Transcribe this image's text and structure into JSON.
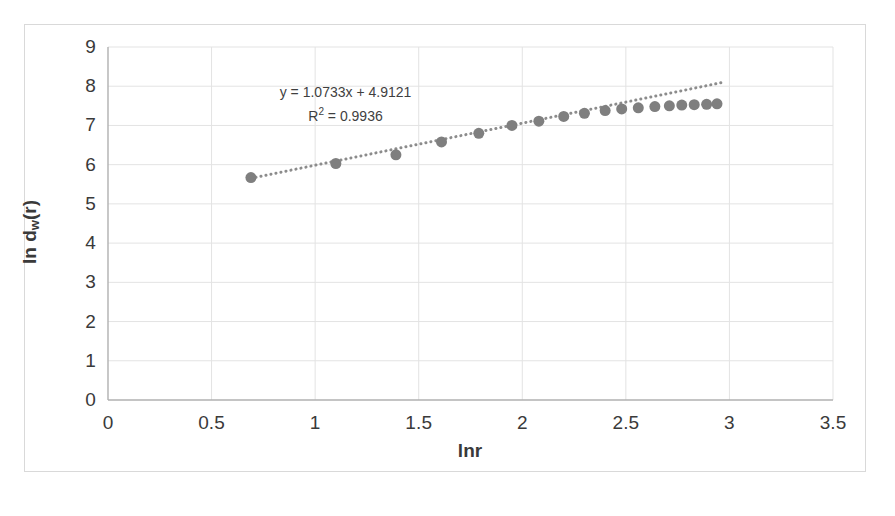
{
  "chart_data": {
    "type": "scatter",
    "title": "",
    "xlabel": "lnr",
    "ylabel": "ln dw(r)",
    "ylabel_base": "ln d",
    "ylabel_sub": "w",
    "ylabel_tail": "(r)",
    "xlim": [
      0,
      3.5
    ],
    "ylim": [
      0,
      9
    ],
    "xticks": [
      "0",
      "0.5",
      "1",
      "1.5",
      "2",
      "2.5",
      "3",
      "3.5"
    ],
    "xtick_values": [
      0,
      0.5,
      1,
      1.5,
      2,
      2.5,
      3,
      3.5
    ],
    "yticks": [
      "0",
      "1",
      "2",
      "3",
      "4",
      "5",
      "6",
      "7",
      "8",
      "9"
    ],
    "ytick_values": [
      0,
      1,
      2,
      3,
      4,
      5,
      6,
      7,
      8,
      9
    ],
    "grid": true,
    "legend": "none",
    "marker": {
      "shape": "circle",
      "color": "#7f7f7f",
      "size": 11
    },
    "trendline": {
      "style": "dotted",
      "color": "#8c8c8c",
      "width": 3,
      "slope": 1.0733,
      "intercept": 4.9121,
      "x_start": 0.69,
      "x_end": 2.96
    },
    "annotations": {
      "equation": "y = 1.0733x + 4.9121",
      "r_squared_prefix": "R",
      "r_squared_exp": "2",
      "r_squared_value": " = 0.9936"
    },
    "x": [
      0.69,
      1.1,
      1.39,
      1.61,
      1.79,
      1.95,
      2.08,
      2.2,
      2.3,
      2.4,
      2.48,
      2.56,
      2.64,
      2.71,
      2.77,
      2.83,
      2.89,
      2.94
    ],
    "y": [
      5.67,
      6.03,
      6.25,
      6.58,
      6.8,
      7.0,
      7.11,
      7.23,
      7.31,
      7.38,
      7.42,
      7.45,
      7.48,
      7.5,
      7.52,
      7.53,
      7.54,
      7.55
    ],
    "points": [
      {
        "x": 0.69,
        "y": 5.67
      },
      {
        "x": 1.1,
        "y": 6.03
      },
      {
        "x": 1.39,
        "y": 6.25
      },
      {
        "x": 1.61,
        "y": 6.58
      },
      {
        "x": 1.79,
        "y": 6.8
      },
      {
        "x": 1.95,
        "y": 7.0
      },
      {
        "x": 2.08,
        "y": 7.11
      },
      {
        "x": 2.2,
        "y": 7.23
      },
      {
        "x": 2.3,
        "y": 7.31
      },
      {
        "x": 2.4,
        "y": 7.38
      },
      {
        "x": 2.48,
        "y": 7.42
      },
      {
        "x": 2.56,
        "y": 7.45
      },
      {
        "x": 2.64,
        "y": 7.48
      },
      {
        "x": 2.71,
        "y": 7.5
      },
      {
        "x": 2.77,
        "y": 7.52
      },
      {
        "x": 2.83,
        "y": 7.53
      },
      {
        "x": 2.89,
        "y": 7.54
      },
      {
        "x": 2.94,
        "y": 7.55
      }
    ]
  },
  "colors": {
    "marker": "#7f7f7f",
    "trendline": "#8c8c8c",
    "grid": "#e3e3e3",
    "axis": "#b0b0b0",
    "text": "#3a3a3a",
    "frame": "#d9d9d9",
    "background": "#ffffff"
  }
}
